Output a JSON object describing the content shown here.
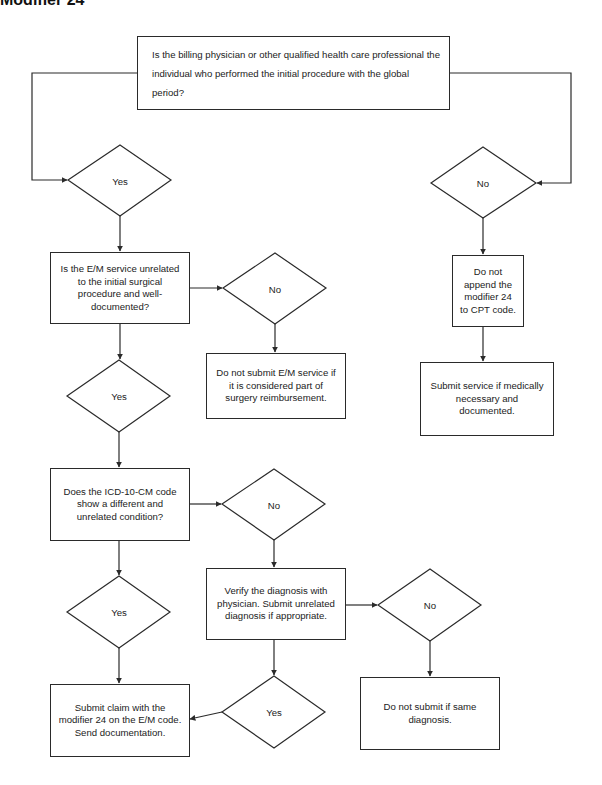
{
  "header": {
    "title": "Modifier 24"
  },
  "nodes": {
    "q1": "Is the billing physician or other qualified health care professional the individual who performed the initial procedure with the global period?",
    "q1_yes": "Yes",
    "q1_no": "No",
    "q2": "Is the E/M service unrelated to the initial surgical procedure and well-documented?",
    "q2_no": "No",
    "q2_no_result": "Do not submit E/M service if it is considered part of surgery reimbursement.",
    "q2_yes": "Yes",
    "r1": "Do not append the modifier 24 to CPT code.",
    "r2": "Submit service if medically necessary and documented.",
    "q3": "Does the ICD-10-CM code show a different and unrelated condition?",
    "q3_no": "No",
    "q3_yes": "Yes",
    "verify": "Verify the diagnosis with physician.  Submit unrelated diagnosis if appropriate.",
    "verify_no": "No",
    "verify_yes": "Yes",
    "submit_claim": "Submit claim with the modifier 24 on the E/M code. Send documentation.",
    "same_dx": "Do not submit if same diagnosis."
  },
  "colors": {
    "line": "#2a2a2a",
    "background": "#ffffff"
  }
}
